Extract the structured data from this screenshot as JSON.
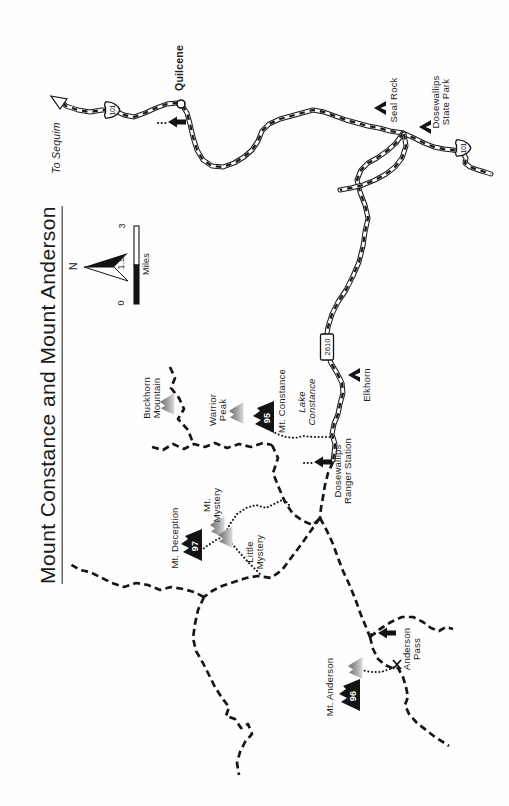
{
  "map": {
    "title": "Mount Constance and Mount Anderson",
    "compass": {
      "north_label": "N"
    },
    "scale_bar": {
      "tick_zero": "0",
      "tick_mid": "1.5",
      "tick_max": "3",
      "units_label": "Miles"
    },
    "route_shields": {
      "us101_north": "101",
      "us101_south": "101",
      "forest_road_2610": "2610"
    },
    "town": {
      "name": "Quilcene"
    },
    "off_map_destination": {
      "label": "To Sequim"
    },
    "campgrounds": [
      {
        "name": "Seal Rock"
      },
      {
        "line1": "Dosewallips",
        "line2": "State Park"
      },
      {
        "name": "Elkhorn"
      }
    ],
    "facilities": {
      "ranger_station": {
        "line1": "Dosewallips",
        "line2": "Ranger Station"
      }
    },
    "lake": {
      "line1": "Lake",
      "line2": "Constance"
    },
    "pass": {
      "line1": "Anderson",
      "line2": "Pass"
    },
    "peaks": {
      "mt_constance": {
        "name": "Mt. Constance",
        "hike_number": "95"
      },
      "mt_deception": {
        "name": "Mt. Deception",
        "hike_number": "97"
      },
      "mt_anderson": {
        "name": "Mt. Anderson",
        "hike_number": "96"
      },
      "buckhorn_mountain": {
        "line1": "Buckhorn",
        "line2": "Mountain"
      },
      "warrior_peak": {
        "line1": "Warrior",
        "line2": "Peak"
      },
      "mt_mystery": {
        "line1": "Mt.",
        "line2": "Mystery"
      },
      "little_mystery": {
        "line1": "Little",
        "line2": "Mystery"
      }
    },
    "colors": {
      "ink": "#1b1b1b",
      "paper": "#fefefe",
      "gray_peak": "#8a8a8a"
    }
  }
}
